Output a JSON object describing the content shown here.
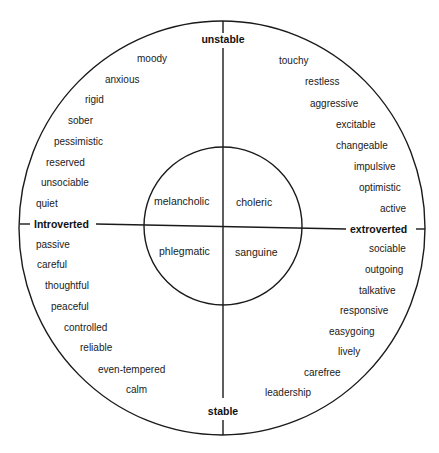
{
  "diagram": {
    "axes": {
      "top": "unstable",
      "bottom": "stable",
      "left": "Introverted",
      "right": "extroverted"
    },
    "temperaments": {
      "top_left": "melancholic",
      "top_right": "choleric",
      "bottom_left": "phlegmatic",
      "bottom_right": "sanguine"
    },
    "traits": {
      "top_left": [
        {
          "text": "moody",
          "x": 137,
          "y": 62
        },
        {
          "text": "anxious",
          "x": 105,
          "y": 83
        },
        {
          "text": "rigid",
          "x": 85,
          "y": 103
        },
        {
          "text": "sober",
          "x": 68,
          "y": 124
        },
        {
          "text": "pessimistic",
          "x": 54,
          "y": 145
        },
        {
          "text": "reserved",
          "x": 46,
          "y": 166
        },
        {
          "text": "unsociable",
          "x": 41,
          "y": 186
        },
        {
          "text": "quiet",
          "x": 36,
          "y": 207
        }
      ],
      "top_right": [
        {
          "text": "touchy",
          "x": 279,
          "y": 64
        },
        {
          "text": "restless",
          "x": 305,
          "y": 85
        },
        {
          "text": "aggressive",
          "x": 310,
          "y": 107
        },
        {
          "text": "excitable",
          "x": 336,
          "y": 128
        },
        {
          "text": "changeable",
          "x": 336,
          "y": 149
        },
        {
          "text": "impulsive",
          "x": 354,
          "y": 170
        },
        {
          "text": "optimistic",
          "x": 359,
          "y": 191
        },
        {
          "text": "active",
          "x": 380,
          "y": 212
        }
      ],
      "bottom_left": [
        {
          "text": "passive",
          "x": 36,
          "y": 248
        },
        {
          "text": "careful",
          "x": 37,
          "y": 268
        },
        {
          "text": "thoughtful",
          "x": 45,
          "y": 289
        },
        {
          "text": "peaceful",
          "x": 51,
          "y": 310
        },
        {
          "text": "controlled",
          "x": 64,
          "y": 331
        },
        {
          "text": "reliable",
          "x": 80,
          "y": 351
        },
        {
          "text": "even-tempered",
          "x": 98,
          "y": 373
        },
        {
          "text": "calm",
          "x": 126,
          "y": 393
        }
      ],
      "bottom_right": [
        {
          "text": "sociable",
          "x": 369,
          "y": 252
        },
        {
          "text": "outgoing",
          "x": 365,
          "y": 273
        },
        {
          "text": "talkative",
          "x": 359,
          "y": 294
        },
        {
          "text": "responsive",
          "x": 340,
          "y": 314
        },
        {
          "text": "easygoing",
          "x": 329,
          "y": 335
        },
        {
          "text": "lively",
          "x": 338,
          "y": 355
        },
        {
          "text": "carefree",
          "x": 304,
          "y": 376
        },
        {
          "text": "leadership",
          "x": 265,
          "y": 396
        }
      ]
    },
    "colors": {
      "ink": "#1a1a1a",
      "background": "#ffffff"
    }
  }
}
